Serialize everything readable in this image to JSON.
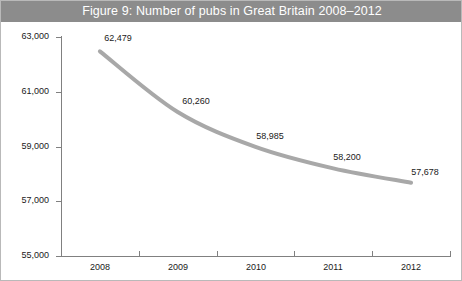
{
  "figure": {
    "title": "Figure 9: Number of pubs in Great Britain 2008–2012",
    "banner_color": "#8c8c8c",
    "banner_text_color": "#ffffff",
    "border_color": "#b9b9b9",
    "background": "#ffffff"
  },
  "chart_data": {
    "type": "line",
    "title": "Figure 9: Number of pubs in Great Britain 2008–2012",
    "xlabel": "",
    "ylabel": "",
    "categories": [
      "2008",
      "2009",
      "2010",
      "2011",
      "2012"
    ],
    "values": [
      62479,
      60260,
      58985,
      58200,
      57678
    ],
    "point_labels": [
      "62,479",
      "60,260",
      "58,985",
      "58,200",
      "57,678"
    ],
    "ylim": [
      55000,
      63000
    ],
    "ytick_values": [
      55000,
      57000,
      59000,
      61000,
      63000
    ],
    "ytick_labels": [
      "55,000",
      "57,000",
      "59,000",
      "61,000",
      "63,000"
    ],
    "grid": false,
    "legend": false,
    "series_color": "#a8a8a8",
    "series_width": 4,
    "axis_color": "#808080",
    "tick_label_color": "#1a1a1a"
  }
}
